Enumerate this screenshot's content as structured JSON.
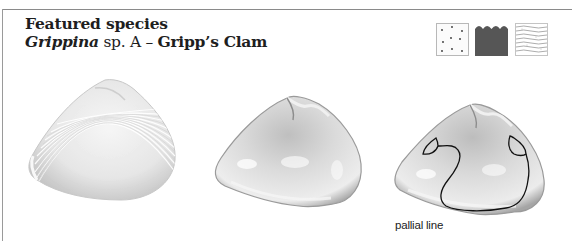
{
  "header": {
    "title": "Featured species",
    "genus": "Grippina",
    "species_suffix": " sp. A",
    "separator": " – ",
    "common_name": "Gripp’s Clam"
  },
  "habitat_icons": [
    {
      "name": "sand-habitat-icon",
      "pattern": "dots"
    },
    {
      "name": "water-habitat-icon",
      "pattern": "waves"
    },
    {
      "name": "mud-habitat-icon",
      "pattern": "wavy-lines"
    }
  ],
  "shells": [
    {
      "view": "exterior"
    },
    {
      "view": "interior"
    },
    {
      "view": "interior-annotated"
    }
  ],
  "annotation": {
    "pallial_line_label": "pallial line"
  },
  "colors": {
    "text": "#1e1e1e",
    "frame": "#8a8a8a",
    "water": "#555555",
    "shell_light": "#f2f2f2",
    "shell_mid": "#cfcfcf",
    "pallial_line": "#111111"
  }
}
